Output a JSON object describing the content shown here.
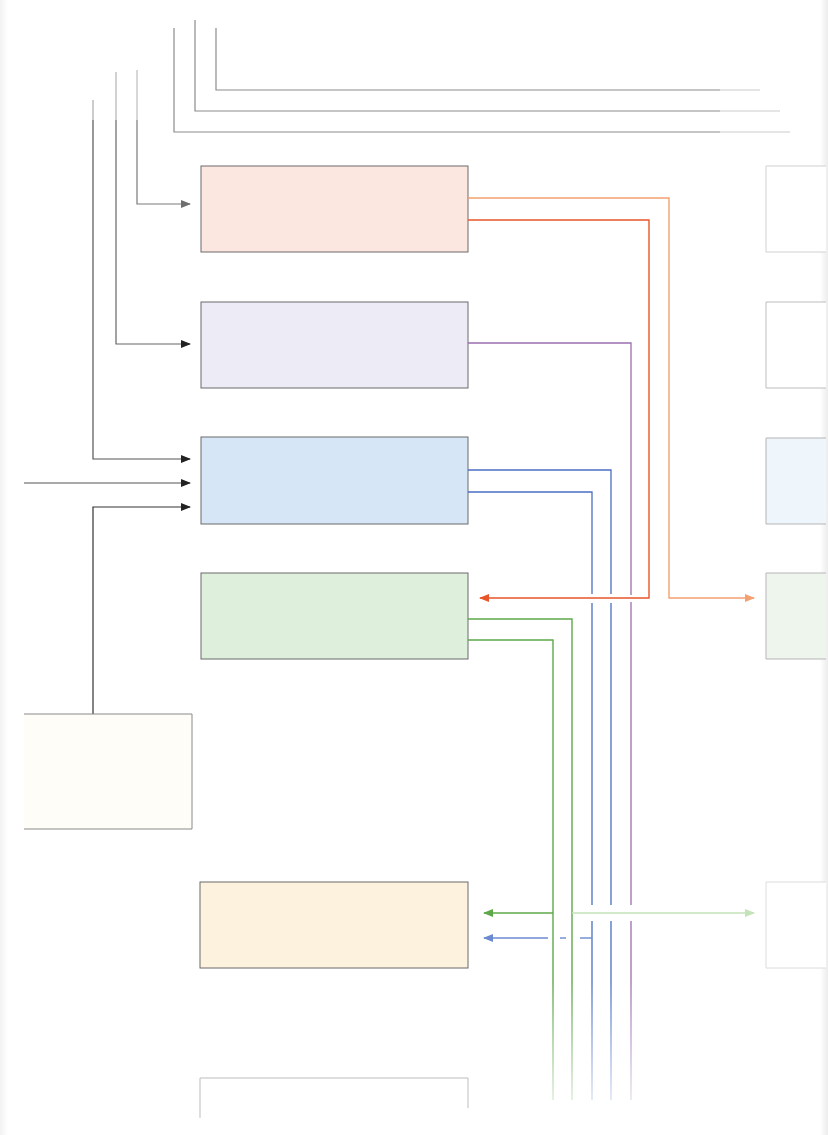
{
  "diagram": {
    "type": "block-flow",
    "colors": {
      "gray_line": "#8a8a8a",
      "dark_line": "#333333",
      "orange": "#f08a50",
      "red_orange": "#e8552a",
      "purple": "#9b6fb0",
      "blue": "#4a6fc4",
      "green": "#5ea84a",
      "light_green": "#b5dca8",
      "light_blue": "#7d9ad8"
    },
    "boxes": [
      {
        "id": "box-red",
        "x": 201,
        "y": 166,
        "w": 267,
        "h": 86,
        "fill": "#fce6e0",
        "label": ""
      },
      {
        "id": "box-purple",
        "x": 201,
        "y": 302,
        "w": 267,
        "h": 86,
        "fill": "#ece9f5",
        "label": ""
      },
      {
        "id": "box-blue",
        "x": 201,
        "y": 437,
        "w": 267,
        "h": 87,
        "fill": "#d6e6f6",
        "label": ""
      },
      {
        "id": "box-green",
        "x": 201,
        "y": 573,
        "w": 267,
        "h": 86,
        "fill": "#deefdc",
        "label": ""
      },
      {
        "id": "box-source",
        "x": 24,
        "y": 714,
        "w": 168,
        "h": 115,
        "fill": "#fefdf8",
        "label": ""
      },
      {
        "id": "box-yellow",
        "x": 200,
        "y": 882,
        "w": 268,
        "h": 86,
        "fill": "#fdf3e0",
        "label": ""
      },
      {
        "id": "box-bottom",
        "x": 200,
        "y": 1078,
        "w": 268,
        "h": 40,
        "fill": "#ffffff",
        "label": ""
      },
      {
        "id": "box-right-1",
        "x": 766,
        "y": 166,
        "w": 60,
        "h": 86,
        "fill": "#ffffff",
        "label": ""
      },
      {
        "id": "box-right-2",
        "x": 766,
        "y": 302,
        "w": 60,
        "h": 86,
        "fill": "#ffffff",
        "label": ""
      },
      {
        "id": "box-right-3",
        "x": 766,
        "y": 438,
        "w": 60,
        "h": 86,
        "fill": "#eef5fb",
        "label": ""
      },
      {
        "id": "box-right-4",
        "x": 766,
        "y": 573,
        "w": 60,
        "h": 86,
        "fill": "#eef5ec",
        "label": ""
      },
      {
        "id": "box-right-5",
        "x": 766,
        "y": 882,
        "w": 60,
        "h": 86,
        "fill": "#ffffff",
        "label": ""
      }
    ]
  }
}
